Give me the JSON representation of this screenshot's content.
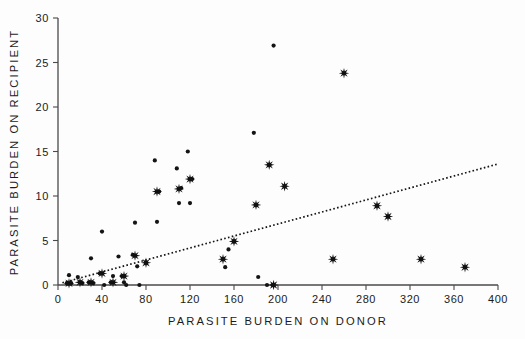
{
  "figure": {
    "background": "#fdfdfd",
    "ink_color": "#141414",
    "axis_color": "#4a4a4a"
  },
  "chart_data": {
    "type": "scatter",
    "title": "",
    "xlabel": "PARASITE  BURDEN  ON  DONOR",
    "ylabel": "PARASITE  BURDEN  ON  RECIPIENT",
    "xlim": [
      0,
      400
    ],
    "ylim": [
      0,
      30
    ],
    "xticks": [
      0,
      40,
      80,
      120,
      160,
      200,
      240,
      280,
      320,
      360,
      400
    ],
    "yticks": [
      0,
      5,
      10,
      15,
      20,
      25,
      30
    ],
    "xticklabels": [
      "0",
      "40",
      "80",
      "120",
      "160",
      "200",
      "240",
      "280",
      "320",
      "360",
      "400"
    ],
    "yticklabels": [
      "0",
      "5",
      "10",
      "15",
      "20",
      "25",
      "30"
    ],
    "grid": false,
    "legend": null,
    "series": [
      {
        "name": "individual-observations",
        "marker": "small-dot",
        "marker_size": 2.1,
        "color": "#141414",
        "points": [
          [
            8,
            0.2
          ],
          [
            10,
            1.1
          ],
          [
            12,
            0.2
          ],
          [
            18,
            0.9
          ],
          [
            20,
            0.3
          ],
          [
            22,
            0.2
          ],
          [
            28,
            0.3
          ],
          [
            30,
            3.0
          ],
          [
            32,
            0.2
          ],
          [
            38,
            1.3
          ],
          [
            40,
            6.0
          ],
          [
            42,
            0.0
          ],
          [
            48,
            0.3
          ],
          [
            50,
            1.0
          ],
          [
            55,
            3.2
          ],
          [
            58,
            1.0
          ],
          [
            60,
            0.3
          ],
          [
            62,
            0.0
          ],
          [
            68,
            3.4
          ],
          [
            70,
            7.0
          ],
          [
            72,
            2.1
          ],
          [
            74,
            0.0
          ],
          [
            80,
            2.5
          ],
          [
            88,
            14.0
          ],
          [
            90,
            7.1
          ],
          [
            92,
            10.5
          ],
          [
            108,
            13.1
          ],
          [
            110,
            9.2
          ],
          [
            112,
            10.9
          ],
          [
            118,
            15.0
          ],
          [
            120,
            9.2
          ],
          [
            122,
            11.9
          ],
          [
            150,
            2.9
          ],
          [
            152,
            2.0
          ],
          [
            155,
            4.0
          ],
          [
            160,
            4.9
          ],
          [
            178,
            17.1
          ],
          [
            180,
            9.0
          ],
          [
            182,
            0.9
          ],
          [
            190,
            0.0
          ],
          [
            192,
            13.5
          ],
          [
            195,
            0.0
          ],
          [
            196,
            26.9
          ]
        ]
      },
      {
        "name": "group-means",
        "marker": "eight-point-star",
        "marker_size": 5.2,
        "color": "#101010",
        "points": [
          [
            10,
            0.2
          ],
          [
            20,
            0.3
          ],
          [
            30,
            0.3
          ],
          [
            40,
            1.3
          ],
          [
            50,
            0.3
          ],
          [
            60,
            1.0
          ],
          [
            70,
            3.3
          ],
          [
            80,
            2.5
          ],
          [
            90,
            10.5
          ],
          [
            110,
            10.8
          ],
          [
            120,
            11.9
          ],
          [
            150,
            2.9
          ],
          [
            160,
            4.9
          ],
          [
            180,
            9.0
          ],
          [
            192,
            13.5
          ],
          [
            196,
            0.0
          ],
          [
            206,
            11.1
          ],
          [
            250,
            2.9
          ],
          [
            260,
            23.8
          ],
          [
            290,
            8.9
          ],
          [
            300,
            7.7
          ],
          [
            330,
            2.9
          ],
          [
            370,
            2.0
          ]
        ]
      }
    ],
    "fit_line": {
      "name": "regression-line",
      "style": "dotted",
      "x_start": 4,
      "y_start": 0.25,
      "x_end": 400,
      "y_end": 13.6
    }
  }
}
